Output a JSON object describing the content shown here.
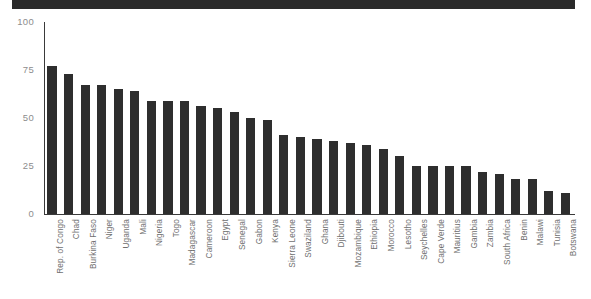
{
  "banner": {
    "name": "title-banner",
    "color": "#2b2b2b"
  },
  "chart_data": {
    "type": "bar",
    "title": "",
    "subtitle": "",
    "xlabel": "",
    "ylabel": "",
    "ylim": [
      0,
      100
    ],
    "yticks": [
      0,
      25,
      50,
      75,
      100
    ],
    "grid": false,
    "legend": false,
    "legend_position": "none",
    "bar_color": "#2e2e2e",
    "axis_color": "#3a3a3a",
    "tick_label_color": "#8d8d8d",
    "category_label_color": "#6f6f6f",
    "orientation": "vertical",
    "sorted": "descending",
    "categories": [
      "Rep. of Congo",
      "Chad",
      "Burkina Faso",
      "Niger",
      "Uganda",
      "Mali",
      "Nigeria",
      "Togo",
      "Madagascar",
      "Cameroon",
      "Egypt",
      "Senegal",
      "Gabon",
      "Kenya",
      "Sierra Leone",
      "Swaziland",
      "Ghana",
      "Djibouti",
      "Mozambique",
      "Ethiopia",
      "Morocco",
      "Lesotho",
      "Seychelles",
      "Cape Verde",
      "Mauritius",
      "Gambia",
      "Zambia",
      "South Africa",
      "Benin",
      "Malawi",
      "Tunisia",
      "Botswana"
    ],
    "values": [
      77,
      73,
      67,
      67,
      65,
      64,
      59,
      59,
      59,
      56,
      55,
      53,
      50,
      49,
      41,
      40,
      39,
      38,
      37,
      36,
      34,
      30,
      25,
      25,
      25,
      25,
      22,
      21,
      18,
      18,
      12,
      11
    ]
  }
}
